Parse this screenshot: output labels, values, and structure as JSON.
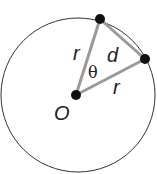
{
  "diagram": {
    "labels": {
      "radius_left": "r",
      "radius_bottom": "r",
      "chord": "d",
      "angle": "θ",
      "center": "O"
    },
    "colors": {
      "circle": "#333333",
      "segments": "#9a9a9a",
      "points": "#111111"
    }
  }
}
